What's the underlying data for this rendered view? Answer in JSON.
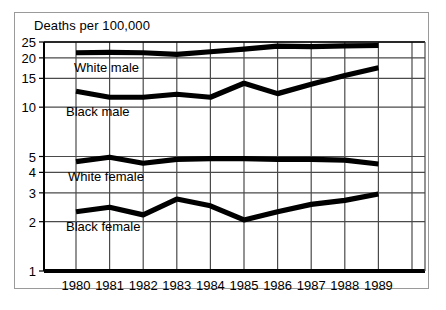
{
  "chart_data": {
    "type": "line",
    "title": "Deaths per 100,000",
    "xlabel": "",
    "ylabel": "Deaths per 100,000",
    "yscale": "log",
    "ylim": [
      1,
      25
    ],
    "grid": true,
    "legend_position": "inline-labels",
    "categories": [
      "1980",
      "1981",
      "1982",
      "1983",
      "1984",
      "1985",
      "1986",
      "1987",
      "1988",
      "1989"
    ],
    "x": [
      1980,
      1981,
      1982,
      1983,
      1984,
      1985,
      1986,
      1987,
      1988,
      1989
    ],
    "ytick_labels": [
      "25",
      "20",
      "15",
      "10",
      "5",
      "4",
      "3",
      "2",
      "1"
    ],
    "ytick_values": [
      25,
      20,
      15,
      10,
      5,
      4,
      3,
      2,
      1
    ],
    "series": [
      {
        "name": "White male",
        "color": "#000000",
        "values": [
          21.5,
          21.6,
          21.5,
          21.0,
          21.8,
          22.6,
          23.6,
          23.4,
          23.7,
          23.8
        ]
      },
      {
        "name": "Black male",
        "color": "#000000",
        "values": [
          12.5,
          11.5,
          11.5,
          12.0,
          11.5,
          14.0,
          12.1,
          13.8,
          15.6,
          17.4
        ]
      },
      {
        "name": "White female",
        "color": "#000000",
        "values": [
          4.65,
          4.95,
          4.55,
          4.8,
          4.85,
          4.85,
          4.8,
          4.8,
          4.75,
          4.5
        ]
      },
      {
        "name": "Black female",
        "color": "#000000",
        "values": [
          2.3,
          2.45,
          2.2,
          2.75,
          2.5,
          2.05,
          2.3,
          2.55,
          2.7,
          2.95
        ]
      }
    ]
  },
  "axis": {
    "title_text": "Deaths per 100,000"
  }
}
